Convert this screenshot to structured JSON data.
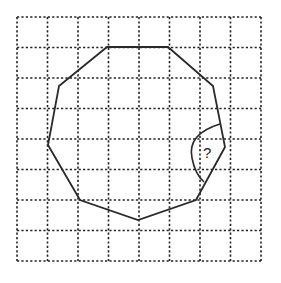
{
  "figure": {
    "type": "geometry-diagram",
    "grid": {
      "columns": 8,
      "rows": 8,
      "line_style": "dashed"
    },
    "polygon": {
      "vertex_count": 9,
      "vertices_grid": [
        [
          3,
          1
        ],
        [
          5,
          1
        ],
        [
          6.5,
          2.3
        ],
        [
          6.9,
          4.2
        ],
        [
          5.9,
          6
        ],
        [
          4,
          6.6
        ],
        [
          2.1,
          6
        ],
        [
          1,
          4.2
        ],
        [
          1.4,
          2.3
        ]
      ]
    },
    "angle_marker": {
      "label": "?",
      "vertex_index": 3
    }
  }
}
